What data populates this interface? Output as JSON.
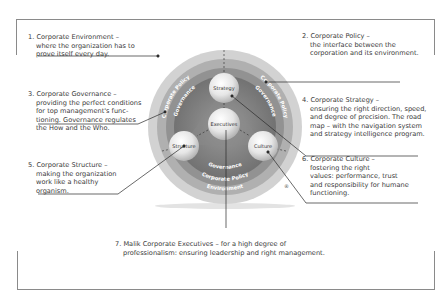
{
  "items": [
    {
      "num": "1.",
      "title": "Corporate Environment –",
      "lines": [
        "where the  organization has to",
        "prove itself every day."
      ]
    },
    {
      "num": "2.",
      "title": "Corporate Policy –",
      "lines": [
        "the interface between the",
        "corporation and its environment."
      ]
    },
    {
      "num": "3.",
      "title": "Corporate Governance –",
      "lines": [
        "providing the perfect conditions",
        "for top management's func-",
        "tioning. Governance regulates",
        "the How and the Who."
      ]
    },
    {
      "num": "4.",
      "title": "Corporate Strategy –",
      "lines": [
        "ensuring the right direction, speed,",
        "and degree of precision. The road",
        "map – with the navigation system",
        "and strategy intelligence program."
      ]
    },
    {
      "num": "5.",
      "title": "Corporate Structure –",
      "lines": [
        "making the organization",
        "work like a healthy",
        "organism."
      ]
    },
    {
      "num": "6.",
      "title": "Corporate Culture –",
      "lines": [
        "fostering  the right",
        "values: performance, trust",
        "and responsibility for humane",
        "functioning."
      ]
    },
    {
      "num": "7.",
      "title": "Malik Corporate Executives – for a high degree of",
      "lines": [
        "professionalism: ensuring leadership and right management."
      ]
    }
  ],
  "diagram": {
    "rings": {
      "environment": "Environment",
      "policy": "Corporate Policy",
      "governance": "Governance"
    },
    "balls": {
      "strategy": "Strategy",
      "executives": "Executives",
      "structure": "Structure",
      "culture": "Culture"
    },
    "registered_mark": "®",
    "colors": {
      "environment_ring": "#c9c9c9",
      "policy_ring": "#a8a8a8",
      "governance_ring": "#8c8c8c",
      "inner": "#7a7a7a",
      "ball": "#e8e8e8",
      "lines": "#2a2a2a"
    }
  }
}
